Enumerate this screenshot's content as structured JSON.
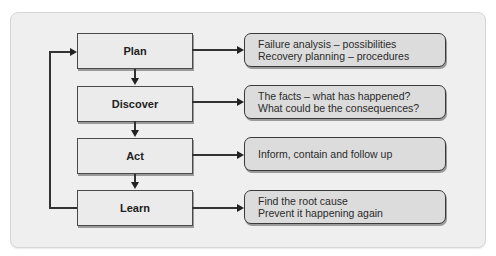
{
  "diagram": {
    "type": "process-cycle",
    "steps": [
      {
        "label": "Plan",
        "notes": [
          "Failure analysis – possibilities",
          "Recovery planning – procedures"
        ]
      },
      {
        "label": "Discover",
        "notes": [
          "The facts – what has happened?",
          "What could be the consequences?"
        ]
      },
      {
        "label": "Act",
        "notes": [
          "Inform, contain and follow up"
        ]
      },
      {
        "label": "Learn",
        "notes": [
          "Find the root cause",
          "Prevent it happening again"
        ]
      }
    ],
    "flow": [
      "Plan → Discover",
      "Discover → Act",
      "Act → Learn",
      "Learn → Plan (feedback loop)"
    ],
    "colors": {
      "panel_bg": "#efefef",
      "step_bg": "#ebebeb",
      "note_bg": "#dcdcdc",
      "line": "#333333"
    }
  }
}
